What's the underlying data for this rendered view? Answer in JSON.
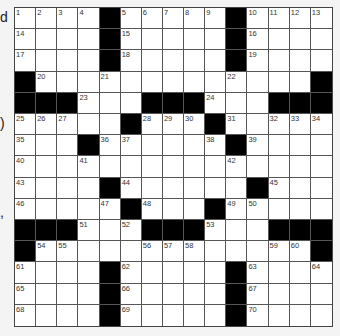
{
  "edge_fragments": [
    {
      "text": "d",
      "y": 10
    },
    {
      "text": ")",
      "y": 116
    },
    {
      "text": ",",
      "y": 205
    }
  ],
  "grid": {
    "rows": 15,
    "cols": 15,
    "black_cells": [
      [
        0,
        4
      ],
      [
        0,
        10
      ],
      [
        1,
        4
      ],
      [
        1,
        10
      ],
      [
        2,
        4
      ],
      [
        2,
        10
      ],
      [
        3,
        0
      ],
      [
        3,
        14
      ],
      [
        4,
        0
      ],
      [
        4,
        1
      ],
      [
        4,
        2
      ],
      [
        4,
        6
      ],
      [
        4,
        7
      ],
      [
        4,
        8
      ],
      [
        4,
        12
      ],
      [
        4,
        13
      ],
      [
        4,
        14
      ],
      [
        5,
        5
      ],
      [
        5,
        9
      ],
      [
        6,
        3
      ],
      [
        6,
        10
      ],
      [
        8,
        4
      ],
      [
        8,
        11
      ],
      [
        9,
        5
      ],
      [
        9,
        9
      ],
      [
        10,
        0
      ],
      [
        10,
        1
      ],
      [
        10,
        2
      ],
      [
        10,
        6
      ],
      [
        10,
        7
      ],
      [
        10,
        8
      ],
      [
        10,
        12
      ],
      [
        10,
        13
      ],
      [
        10,
        14
      ],
      [
        11,
        0
      ],
      [
        11,
        14
      ],
      [
        12,
        4
      ],
      [
        12,
        10
      ],
      [
        13,
        4
      ],
      [
        13,
        10
      ],
      [
        14,
        4
      ],
      [
        14,
        10
      ]
    ],
    "numbers": [
      {
        "n": "1",
        "r": 0,
        "c": 0
      },
      {
        "n": "2",
        "r": 0,
        "c": 1
      },
      {
        "n": "3",
        "r": 0,
        "c": 2
      },
      {
        "n": "4",
        "r": 0,
        "c": 3
      },
      {
        "n": "5",
        "r": 0,
        "c": 5
      },
      {
        "n": "6",
        "r": 0,
        "c": 6
      },
      {
        "n": "7",
        "r": 0,
        "c": 7
      },
      {
        "n": "8",
        "r": 0,
        "c": 8
      },
      {
        "n": "9",
        "r": 0,
        "c": 9
      },
      {
        "n": "10",
        "r": 0,
        "c": 11
      },
      {
        "n": "11",
        "r": 0,
        "c": 12
      },
      {
        "n": "12",
        "r": 0,
        "c": 13
      },
      {
        "n": "13",
        "r": 0,
        "c": 14
      },
      {
        "n": "14",
        "r": 1,
        "c": 0
      },
      {
        "n": "15",
        "r": 1,
        "c": 5
      },
      {
        "n": "16",
        "r": 1,
        "c": 11
      },
      {
        "n": "17",
        "r": 2,
        "c": 0
      },
      {
        "n": "18",
        "r": 2,
        "c": 5
      },
      {
        "n": "19",
        "r": 2,
        "c": 11
      },
      {
        "n": "20",
        "r": 3,
        "c": 1
      },
      {
        "n": "21",
        "r": 3,
        "c": 4
      },
      {
        "n": "22",
        "r": 3,
        "c": 10
      },
      {
        "n": "23",
        "r": 4,
        "c": 3
      },
      {
        "n": "24",
        "r": 4,
        "c": 9
      },
      {
        "n": "25",
        "r": 5,
        "c": 0
      },
      {
        "n": "26",
        "r": 5,
        "c": 1
      },
      {
        "n": "27",
        "r": 5,
        "c": 2
      },
      {
        "n": "28",
        "r": 5,
        "c": 6
      },
      {
        "n": "29",
        "r": 5,
        "c": 7
      },
      {
        "n": "30",
        "r": 5,
        "c": 8
      },
      {
        "n": "31",
        "r": 5,
        "c": 10
      },
      {
        "n": "32",
        "r": 5,
        "c": 12
      },
      {
        "n": "33",
        "r": 5,
        "c": 13
      },
      {
        "n": "34",
        "r": 5,
        "c": 14
      },
      {
        "n": "35",
        "r": 6,
        "c": 0
      },
      {
        "n": "36",
        "r": 6,
        "c": 4
      },
      {
        "n": "37",
        "r": 6,
        "c": 5
      },
      {
        "n": "38",
        "r": 6,
        "c": 9
      },
      {
        "n": "39",
        "r": 6,
        "c": 11
      },
      {
        "n": "40",
        "r": 7,
        "c": 0
      },
      {
        "n": "41",
        "r": 7,
        "c": 3
      },
      {
        "n": "42",
        "r": 7,
        "c": 10
      },
      {
        "n": "43",
        "r": 8,
        "c": 0
      },
      {
        "n": "44",
        "r": 8,
        "c": 5
      },
      {
        "n": "45",
        "r": 8,
        "c": 12
      },
      {
        "n": "46",
        "r": 9,
        "c": 0
      },
      {
        "n": "47",
        "r": 9,
        "c": 4
      },
      {
        "n": "48",
        "r": 9,
        "c": 6
      },
      {
        "n": "49",
        "r": 9,
        "c": 10
      },
      {
        "n": "50",
        "r": 9,
        "c": 11
      },
      {
        "n": "51",
        "r": 10,
        "c": 3
      },
      {
        "n": "52",
        "r": 10,
        "c": 5
      },
      {
        "n": "53",
        "r": 10,
        "c": 9
      },
      {
        "n": "54",
        "r": 11,
        "c": 1
      },
      {
        "n": "55",
        "r": 11,
        "c": 2
      },
      {
        "n": "56",
        "r": 11,
        "c": 6
      },
      {
        "n": "57",
        "r": 11,
        "c": 7
      },
      {
        "n": "58",
        "r": 11,
        "c": 8
      },
      {
        "n": "59",
        "r": 11,
        "c": 12
      },
      {
        "n": "60",
        "r": 11,
        "c": 13
      },
      {
        "n": "61",
        "r": 12,
        "c": 0
      },
      {
        "n": "62",
        "r": 12,
        "c": 5
      },
      {
        "n": "63",
        "r": 12,
        "c": 11
      },
      {
        "n": "64",
        "r": 12,
        "c": 14
      },
      {
        "n": "65",
        "r": 13,
        "c": 0
      },
      {
        "n": "66",
        "r": 13,
        "c": 5
      },
      {
        "n": "67",
        "r": 13,
        "c": 11
      },
      {
        "n": "68",
        "r": 14,
        "c": 0
      },
      {
        "n": "69",
        "r": 14,
        "c": 5
      },
      {
        "n": "70",
        "r": 14,
        "c": 11
      }
    ]
  }
}
